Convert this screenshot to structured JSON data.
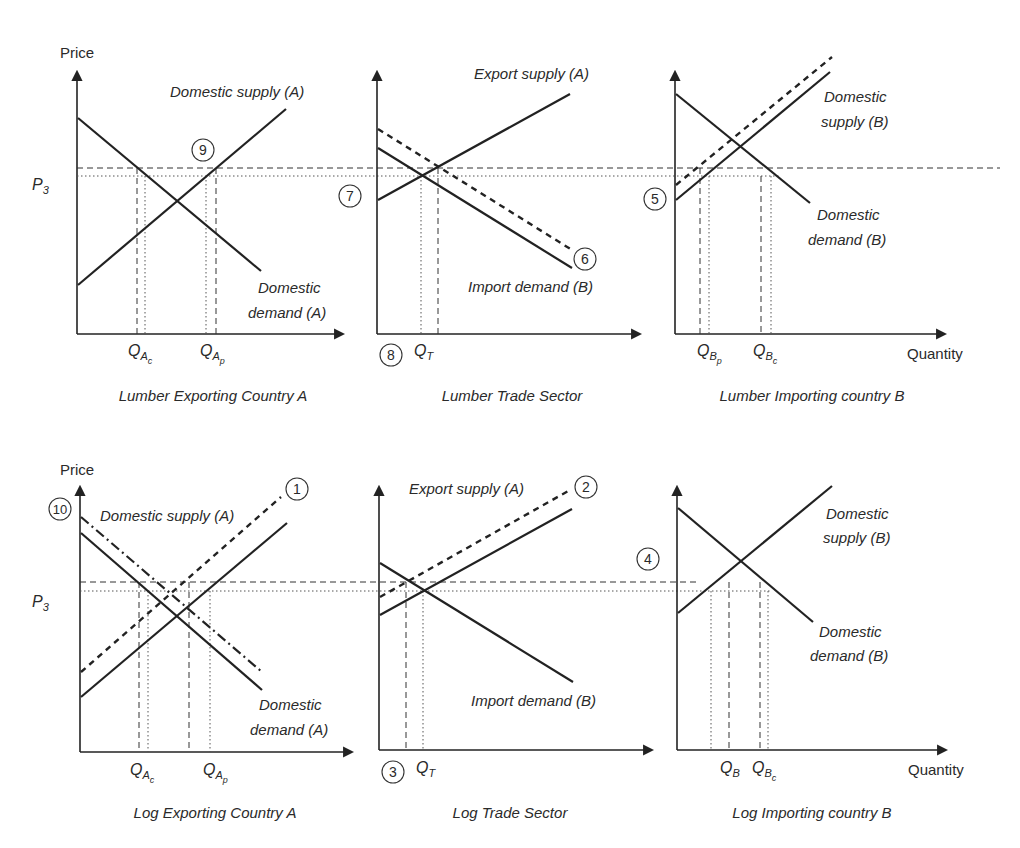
{
  "figure": {
    "axis_labels": {
      "price": "Price",
      "quantity": "Quantity",
      "p3": "P",
      "p3_sub": "3"
    },
    "top_row": {
      "panel_a": {
        "title": "Lumber Exporting Country A",
        "supply_label": "Domestic supply (A)",
        "demand_label_1": "Domestic",
        "demand_label_2": "demand (A)",
        "q_c": {
          "main": "Q",
          "sub": "A",
          "subsub": "c"
        },
        "q_p": {
          "main": "Q",
          "sub": "A",
          "subsub": "p"
        },
        "marker": "9"
      },
      "panel_trade": {
        "title": "Lumber Trade Sector",
        "supply_label": "Export supply (A)",
        "demand_label": "Import demand (B)",
        "q_t": {
          "main": "Q",
          "sub": "T"
        },
        "markers": {
          "m7": "7",
          "m6": "6",
          "m8": "8"
        }
      },
      "panel_b": {
        "title": "Lumber Importing country B",
        "supply_label_1": "Domestic",
        "supply_label_2": "supply (B)",
        "demand_label_1": "Domestic",
        "demand_label_2": "demand (B)",
        "q_p": {
          "main": "Q",
          "sub": "B",
          "subsub": "p"
        },
        "q_c": {
          "main": "Q",
          "sub": "B",
          "subsub": "c"
        },
        "marker": "5"
      }
    },
    "bottom_row": {
      "panel_a": {
        "title": "Log Exporting Country A",
        "supply_label": "Domestic supply (A)",
        "demand_label_1": "Domestic",
        "demand_label_2": "demand (A)",
        "q_c": {
          "main": "Q",
          "sub": "A",
          "subsub": "c"
        },
        "q_p": {
          "main": "Q",
          "sub": "A",
          "subsub": "p"
        },
        "markers": {
          "m10": "10",
          "m1": "1"
        }
      },
      "panel_trade": {
        "title": "Log Trade Sector",
        "supply_label": "Export supply (A)",
        "demand_label": "Import demand (B)",
        "q_t": {
          "main": "Q",
          "sub": "T"
        },
        "markers": {
          "m2": "2",
          "m3": "3"
        }
      },
      "panel_b": {
        "title": "Log Importing country B",
        "supply_label_1": "Domestic",
        "supply_label_2": "supply (B)",
        "demand_label_1": "Domestic",
        "demand_label_2": "demand (B)",
        "q_b": {
          "main": "Q",
          "sub": "B"
        },
        "q_c": {
          "main": "Q",
          "sub": "B",
          "subsub": "c"
        },
        "marker": "4"
      }
    }
  }
}
